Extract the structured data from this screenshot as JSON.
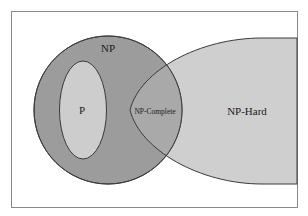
{
  "diagram": {
    "type": "venn",
    "title": "",
    "colors": {
      "background": "#ffffff",
      "frame": "#8a8a8a",
      "np_fill": "#9c9c9c",
      "np_hard_fill": "#cfcfcf",
      "p_fill": "#cdcdcd",
      "overlap_fill": "#a9a9a9",
      "outline": "#3a3a3a",
      "text": "#1a1a1a"
    },
    "sets": [
      {
        "id": "np",
        "label": "NP"
      },
      {
        "id": "p",
        "label": "P"
      },
      {
        "id": "np-complete",
        "label": "NP-Complete"
      },
      {
        "id": "np-hard",
        "label": "NP-Hard"
      }
    ]
  }
}
